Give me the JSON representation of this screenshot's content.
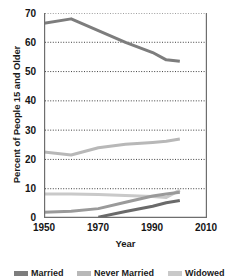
{
  "chart_data": {
    "type": "line",
    "title": "",
    "xlabel": "Year",
    "ylabel": "Percent of People 15 and Older",
    "xlim": [
      1950,
      2010
    ],
    "ylim": [
      0,
      70
    ],
    "xticks": [
      "1950",
      "1970",
      "1990",
      "2010"
    ],
    "yticks": [
      "0",
      "10",
      "20",
      "30",
      "40",
      "50",
      "60",
      "70"
    ],
    "grid": "horizontal-dotted",
    "legend_position": "bottom",
    "x": [
      1950,
      1960,
      1970,
      1980,
      1990,
      1995,
      2000
    ],
    "series": [
      {
        "name": "Married",
        "color": "#7d7d7d",
        "x": [
          1950,
          1960,
          1970,
          1980,
          1990,
          1995,
          2000
        ],
        "values": [
          66.5,
          68.0,
          64.0,
          60.0,
          56.5,
          54.0,
          53.5
        ]
      },
      {
        "name": "Never Married",
        "color": "#b8b8b8",
        "x": [
          1950,
          1960,
          1970,
          1980,
          1990,
          1995,
          2000
        ],
        "values": [
          22.5,
          21.5,
          24.0,
          25.2,
          25.8,
          26.2,
          27.0
        ]
      },
      {
        "name": "Widowed",
        "color": "#c9c9c9",
        "x": [
          1950,
          1960,
          1970,
          1980,
          1990,
          1995,
          2000
        ],
        "values": [
          8.2,
          8.2,
          8.0,
          7.7,
          7.3,
          7.0,
          9.5
        ]
      },
      {
        "name": "Divorced",
        "color": "#9a9a9a",
        "x": [
          1950,
          1960,
          1970,
          1980,
          1990,
          1995,
          2000
        ],
        "values": [
          2.0,
          2.3,
          3.2,
          5.4,
          7.5,
          8.2,
          8.8
        ]
      },
      {
        "name": "Separated",
        "color": "#6a6a6a",
        "x": [
          1970,
          1980,
          1990,
          1995,
          2000
        ],
        "values": [
          0.3,
          2.2,
          4.0,
          5.2,
          6.0
        ]
      }
    ],
    "legend_entries": [
      "Married",
      "Never Married",
      "Widowed"
    ]
  },
  "axes": {
    "yticks": [
      {
        "label": "70",
        "value": 70
      },
      {
        "label": "60",
        "value": 60
      },
      {
        "label": "50",
        "value": 50
      },
      {
        "label": "40",
        "value": 40
      },
      {
        "label": "30",
        "value": 30
      },
      {
        "label": "20",
        "value": 20
      },
      {
        "label": "10",
        "value": 10
      },
      {
        "label": "0",
        "value": 0
      }
    ],
    "xticks": [
      {
        "label": "1950",
        "value": 1950
      },
      {
        "label": "1970",
        "value": 1970
      },
      {
        "label": "1990",
        "value": 1990
      },
      {
        "label": "2010",
        "value": 2010
      }
    ],
    "xlabel": "Year",
    "ylabel": "Percent of People 15 and Older"
  },
  "colors": {
    "axis": "#6e6e6e",
    "grid": "#2a2a2a",
    "text": "#1a1a1a",
    "background": "#ffffff"
  }
}
